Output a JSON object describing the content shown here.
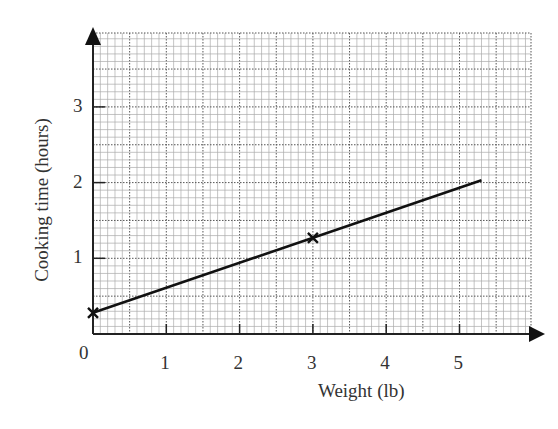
{
  "chart_data": {
    "type": "line",
    "title": "",
    "xlabel": "Weight (lb)",
    "ylabel": "Cooking time (hours)",
    "xlim": [
      0,
      5.9
    ],
    "ylim": [
      0,
      4.0
    ],
    "x_ticks": [
      "0",
      "1",
      "2",
      "3",
      "4",
      "5"
    ],
    "y_ticks": [
      "1",
      "2",
      "3"
    ],
    "grid": true,
    "series": [
      {
        "name": "Cooking time",
        "x": [
          0,
          5.3
        ],
        "values": [
          0.28,
          2.03
        ]
      }
    ],
    "markers": [
      {
        "x": 0,
        "y": 0.28,
        "symbol": "cross"
      },
      {
        "x": 3,
        "y": 1.27,
        "symbol": "cross"
      }
    ]
  },
  "labels": {
    "x_axis": "Weight (lb)",
    "y_axis": "Cooking time (hours)",
    "origin": "0"
  }
}
